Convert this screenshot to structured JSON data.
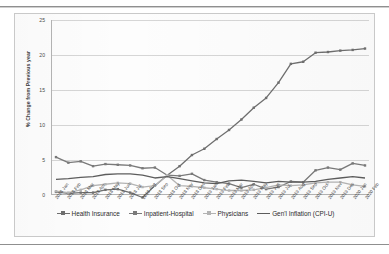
{
  "chart_data": {
    "type": "line",
    "title": "",
    "xlabel": "",
    "ylabel": "% Change from Previous year",
    "ylim": [
      0,
      25
    ],
    "yticks": [
      0,
      5,
      10,
      15,
      20,
      25
    ],
    "grid": true,
    "legend_position": "bottom",
    "categories": [
      "2018 Jan",
      "2018 Feb",
      "2018 Mar",
      "2018 Apr",
      "2018 May",
      "2018 Jun",
      "2018 Jul",
      "2018 Aug",
      "2018 Sep",
      "2018 Oct",
      "2018 Nov",
      "2018 Dec",
      "2019 Jan",
      "2019 Feb",
      "2019 Mar",
      "2019 Apr",
      "2019 May",
      "2019 Jun",
      "2019 Jul",
      "2019 Aug",
      "2019 Sep",
      "2019 Oct",
      "2019 Nov",
      "2019 Dec",
      "2020 Jan",
      "2020 Feb"
    ],
    "series": [
      {
        "name": "Health Insurance",
        "color": "#6f6f6f",
        "values": [
          0.3,
          0.1,
          0.2,
          0.2,
          0.6,
          0.7,
          0.2,
          -0.5,
          1.2,
          2.7,
          4.0,
          5.6,
          6.5,
          7.9,
          9.2,
          10.7,
          12.4,
          13.8,
          16.0,
          18.7,
          19.0,
          20.3,
          20.4,
          20.6,
          20.7,
          20.9
        ]
      },
      {
        "name": "Inpatient-Hospital",
        "color": "#7a7a7a",
        "values": [
          5.3,
          4.5,
          4.7,
          4.0,
          4.3,
          4.2,
          4.1,
          3.7,
          3.8,
          2.7,
          2.6,
          2.9,
          2.0,
          1.7,
          1.5,
          0.9,
          1.4,
          0.7,
          1.0,
          1.8,
          1.7,
          3.4,
          3.8,
          3.5,
          4.4,
          4.1
        ]
      },
      {
        "name": "Physicians",
        "color": "#b4b4b4",
        "values": [
          0.4,
          0.2,
          0.6,
          1.2,
          1.4,
          1.6,
          1.5,
          1.0,
          1.2,
          2.7,
          1.2,
          1.1,
          0.9,
          0.7,
          0.5,
          0.5,
          0.6,
          0.9,
          1.3,
          1.2,
          1.3,
          1.6,
          1.7,
          1.7,
          1.3,
          1.1
        ]
      },
      {
        "name": "Gen'l Inflation (CPI-U)",
        "color": "#5d5d5d",
        "values": [
          2.1,
          2.2,
          2.4,
          2.5,
          2.8,
          2.9,
          2.9,
          2.7,
          2.3,
          2.5,
          2.2,
          1.9,
          1.6,
          1.5,
          1.9,
          2.0,
          1.8,
          1.6,
          1.8,
          1.7,
          1.7,
          1.8,
          2.1,
          2.3,
          2.5,
          2.3
        ]
      }
    ]
  },
  "legend": {
    "items": [
      {
        "label": "Health Insurance"
      },
      {
        "label": "Inpatient-Hospital"
      },
      {
        "label": "Physicians"
      },
      {
        "label": "Gen'l Inflation (CPI-U)"
      }
    ]
  }
}
